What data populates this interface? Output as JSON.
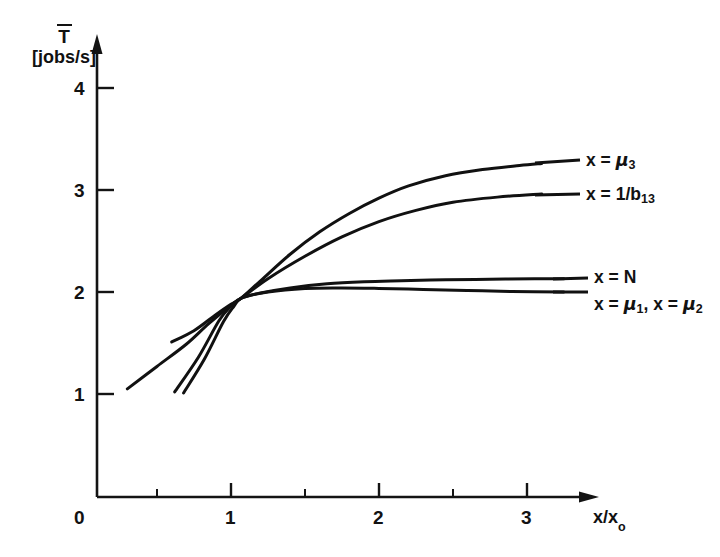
{
  "chart_data": {
    "type": "line",
    "title": "",
    "xlabel": "x/x₀",
    "ylabel": "T̄ [jobs/s]",
    "ylabel_symbol": "T",
    "ylabel_units": "[jobs/s]",
    "xlim": [
      0,
      3.55
    ],
    "ylim": [
      0,
      4.5
    ],
    "grid": false,
    "legend_position": "right-inline",
    "x_ticks": [
      {
        "value": 0,
        "label": "0"
      },
      {
        "value": 1,
        "label": "1"
      },
      {
        "value": 2,
        "label": "2"
      },
      {
        "value": 3,
        "label": "3"
      }
    ],
    "x_minor_ticks": [
      0.5,
      1.5,
      2.5
    ],
    "y_ticks": [
      {
        "value": 1,
        "label": "1"
      },
      {
        "value": 2,
        "label": "2"
      },
      {
        "value": 3,
        "label": "3"
      },
      {
        "value": 4,
        "label": "4"
      }
    ],
    "crossing_point": {
      "x": 1.07,
      "y": 1.95
    },
    "series": [
      {
        "name": "x = μ₃",
        "label_plain": "x = mu_3",
        "x": [
          0.6,
          0.75,
          0.9,
          1.0,
          1.07,
          1.2,
          1.4,
          1.6,
          1.8,
          2.0,
          2.2,
          2.45,
          2.7,
          2.95,
          3.1
        ],
        "y": [
          1.52,
          1.63,
          1.79,
          1.89,
          1.95,
          2.12,
          2.38,
          2.6,
          2.78,
          2.93,
          3.05,
          3.15,
          3.21,
          3.25,
          3.27
        ]
      },
      {
        "name": "x = 1/b₁₃",
        "label_plain": "x = 1/b_13",
        "x": [
          0.3,
          0.5,
          0.7,
          0.85,
          1.0,
          1.07,
          1.25,
          1.5,
          1.75,
          2.0,
          2.25,
          2.5,
          2.8,
          3.1
        ],
        "y": [
          1.06,
          1.28,
          1.5,
          1.7,
          1.88,
          1.95,
          2.14,
          2.36,
          2.55,
          2.7,
          2.81,
          2.89,
          2.94,
          2.97
        ]
      },
      {
        "name": "x = N",
        "label_plain": "x = N",
        "x": [
          0.68,
          0.82,
          0.95,
          1.02,
          1.07,
          1.2,
          1.4,
          1.65,
          1.9,
          2.15,
          2.45,
          2.75,
          3.05,
          3.25
        ],
        "y": [
          1.02,
          1.35,
          1.72,
          1.87,
          1.95,
          2.0,
          2.05,
          2.09,
          2.11,
          2.12,
          2.13,
          2.135,
          2.14,
          2.14
        ]
      },
      {
        "name": "x = μ₁, x = μ₂",
        "label_plain": "x = mu_1, x = mu_2",
        "x": [
          0.62,
          0.78,
          0.92,
          1.0,
          1.07,
          1.25,
          1.5,
          1.75,
          2.0,
          2.3,
          2.6,
          2.9,
          3.25
        ],
        "y": [
          1.03,
          1.37,
          1.73,
          1.87,
          1.95,
          2.01,
          2.045,
          2.05,
          2.045,
          2.035,
          2.025,
          2.015,
          2.01
        ]
      }
    ],
    "annotations": [
      {
        "text": "x = μ₃",
        "at_x": 3.22,
        "at_y": 3.27
      },
      {
        "text": "x = 1/b₁₃",
        "at_x": 3.22,
        "at_y": 2.97
      },
      {
        "text": "x = N",
        "at_x": 3.35,
        "at_y": 2.14
      },
      {
        "text": "x = μ₁, x = μ₂",
        "at_x": 3.35,
        "at_y": 2.01
      }
    ]
  },
  "axis": {
    "y_symbol": "T",
    "y_units": "[jobs/s]",
    "x_title_main": "x/x",
    "x_title_sub": "o",
    "origin_label": "0",
    "y_tick_labels": [
      "1",
      "2",
      "3",
      "4"
    ],
    "x_tick_labels": [
      "1",
      "2",
      "3"
    ]
  },
  "series_labels": {
    "mu3": {
      "prefix": "x = ",
      "symbol": "μ",
      "sub": "3"
    },
    "b13": {
      "prefix": "x = 1/",
      "symbol": "b",
      "sub": "13"
    },
    "n": {
      "text": "x = N"
    },
    "mu12": {
      "prefix": "x = ",
      "symbol1": "μ",
      "sub1": "1",
      "middle": ", x = ",
      "symbol2": "μ",
      "sub2": "2"
    }
  },
  "colors": {
    "background": "#ffffff",
    "ink": "#111111",
    "axis": "#141414"
  }
}
